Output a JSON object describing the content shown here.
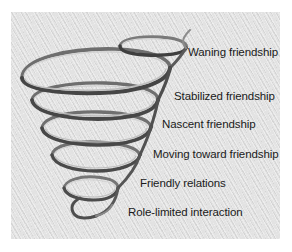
{
  "diagram": {
    "type": "spiral",
    "colors": {
      "background": "#e2e2e2",
      "ribbon_light": "#c9c9c9",
      "ribbon_dark": "#4a4a4a",
      "label_text": "#1a1a1a"
    },
    "stages": [
      {
        "label": "Waning friendship",
        "order": 6
      },
      {
        "label": "Stabilized friendship",
        "order": 5
      },
      {
        "label": "Nascent friendship",
        "order": 4
      },
      {
        "label": "Moving toward friendship",
        "order": 3
      },
      {
        "label": "Friendly relations",
        "order": 2
      },
      {
        "label": "Role-limited interaction",
        "order": 1
      }
    ]
  }
}
